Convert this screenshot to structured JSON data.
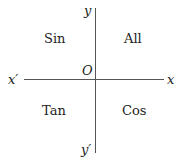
{
  "diagram": {
    "axes": {
      "x_pos": "x",
      "x_neg": "x′",
      "y_pos": "y",
      "y_neg": "y′",
      "origin": "O"
    },
    "quadrants": {
      "q1": "All",
      "q2": "Sin",
      "q3": "Tan",
      "q4": "Cos"
    }
  }
}
